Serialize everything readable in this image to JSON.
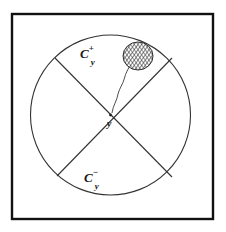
{
  "figure": {
    "kind": "geometric-cone-diagram",
    "frame": {
      "border_color": "#111111",
      "border_width": 2,
      "x": 11,
      "y": 13,
      "width": 203,
      "height": 207,
      "fill": "#ffffff"
    },
    "circle": {
      "name": "boundary-circle",
      "cx": 110.5,
      "cy": 115,
      "r": 80,
      "stroke": "#333333",
      "stroke_width": 1.1,
      "fill": "none"
    },
    "chords": [
      {
        "name": "chord-nw-se",
        "x1": 55,
        "y1": 58,
        "x2": 172,
        "y2": 177,
        "stroke": "#333333",
        "stroke_width": 1.1
      },
      {
        "name": "chord-ne-sw",
        "x1": 172,
        "y1": 58,
        "x2": 57,
        "y2": 176,
        "stroke": "#333333",
        "stroke_width": 1.1
      }
    ],
    "center_point": {
      "name": "cone-apex",
      "cx": 110.5,
      "cy": 115,
      "r": 1.4,
      "fill": "#222222"
    },
    "blob": {
      "name": "hatched-blob",
      "cx": 138,
      "cy": 56,
      "rx": 15,
      "ry": 14,
      "stroke": "#2b2b2b",
      "stroke_width": 1,
      "hatch_color": "#3a3a3a",
      "hatch_spacing": 2.2
    },
    "wavy_path": {
      "name": "wavy-connector",
      "d": "M 112 113 C 113 104, 118 99, 119 92 C 120 86, 124 82, 126 76 C 127 72, 130 69, 131 66",
      "stroke": "#3a3a3a",
      "stroke_width": 0.9
    }
  },
  "labels": {
    "cone_upper": {
      "base": "C",
      "superscript": "+",
      "subscript": "y"
    },
    "cone_lower": {
      "base": "C",
      "superscript": "−",
      "subscript": "y"
    },
    "center": "y"
  },
  "colors": {
    "ink": "#1a1a1a",
    "line": "#333333",
    "frame": "#111111",
    "paper": "#ffffff"
  }
}
